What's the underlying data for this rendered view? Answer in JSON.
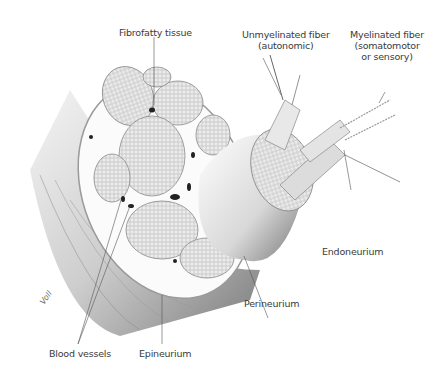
{
  "diagram": {
    "labels": {
      "fibrofatty": "Fibrofatty tissue",
      "unmyelinated_l1": "Unmyelinated fiber",
      "unmyelinated_l2": "(autonomic)",
      "myelinated_l1": "Myelinated fiber",
      "myelinated_l2": "(somatomotor",
      "myelinated_l3": "or sensory)",
      "endoneurium": "Endoneurium",
      "perineurium": "Perineurium",
      "blood_vessels": "Blood vessels",
      "epineurium": "Epineurium"
    },
    "signature": "Voll"
  }
}
